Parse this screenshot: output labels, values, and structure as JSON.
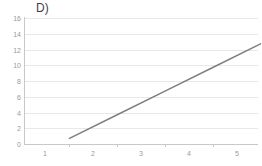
{
  "chart_data": {
    "type": "line",
    "title": "D)",
    "xlabel": "",
    "ylabel": "",
    "x": [
      1,
      2,
      3,
      4,
      5
    ],
    "series": [
      {
        "name": "Series 1",
        "values": [
          3,
          6,
          9,
          12,
          15
        ],
        "color": "#808080"
      }
    ],
    "xlim": [
      0.55,
      5.45
    ],
    "ylim": [
      0,
      16
    ],
    "y_ticks": [
      16,
      14,
      12,
      10,
      8,
      6,
      4,
      2,
      0
    ],
    "x_ticks": [
      1,
      2,
      3,
      4,
      5
    ],
    "x_tick_labels": [
      "1",
      "2",
      "3",
      "4",
      "5"
    ],
    "y_tick_labels": [
      "16",
      "14",
      "12",
      "10",
      "8",
      "6",
      "4",
      "2",
      "0"
    ],
    "grid": "horizontal",
    "grid_color": "#e8e8e8",
    "legend": "none",
    "background": "#ffffff",
    "axis_color": "#c9c9c9",
    "tick_label_color": "#9a9a9a",
    "title_color": "#3f3f3f"
  }
}
